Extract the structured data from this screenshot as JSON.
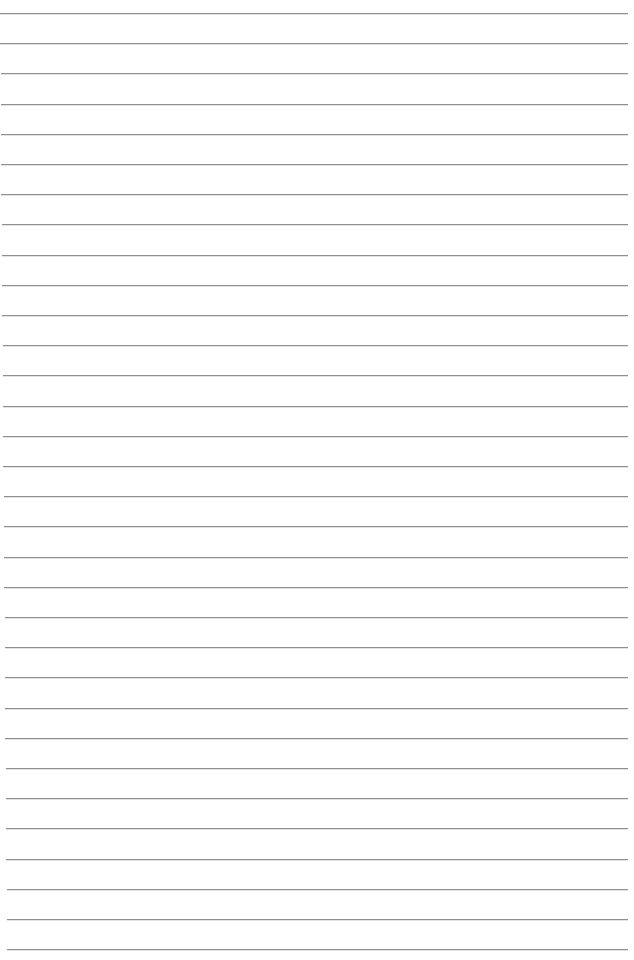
{
  "document": {
    "type": "lined-paper",
    "background_color": "#ffffff",
    "line_color": "#8f8f8f",
    "line_count": 32,
    "first_line_y": 13,
    "line_pitch": 30.2,
    "line_right_end_x": 628,
    "line_left_start_top_x": 0,
    "line_left_start_bottom_x": 7,
    "text_content": []
  }
}
